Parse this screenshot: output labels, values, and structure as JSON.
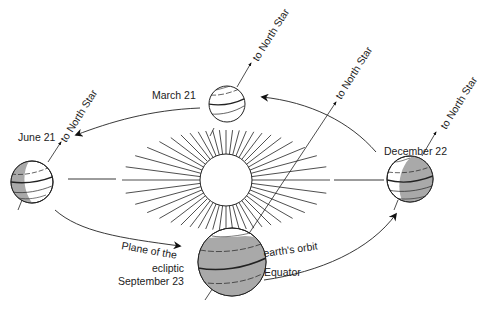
{
  "diagram": {
    "type": "earth-orbit-seasons",
    "center": "sun",
    "labels": {
      "march": "March 21",
      "june": "June 21",
      "september": "September 23",
      "december": "December 22",
      "north_star": "to North Star",
      "plane_of_the": "Plane of the",
      "ecliptic": "ecliptic",
      "earths_orbit": "earth's orbit",
      "equator": "Equator"
    },
    "positions": [
      {
        "date": "March 21",
        "shading": "none"
      },
      {
        "date": "June 21",
        "shading": "left-crescent"
      },
      {
        "date": "September 23",
        "shading": "mostly-shaded"
      },
      {
        "date": "December 22",
        "shading": "right-half"
      }
    ],
    "colors": {
      "line": "#222222",
      "shade": "#a9a9a9",
      "background": "#ffffff"
    }
  }
}
